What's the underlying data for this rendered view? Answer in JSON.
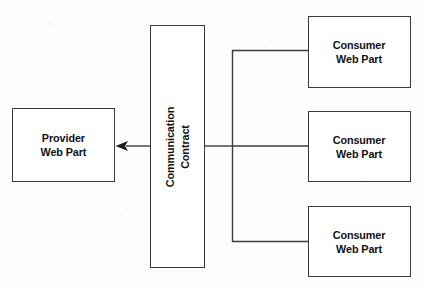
{
  "diagram": {
    "background_color": "#fdfdfd",
    "stroke_color": "#3b3b3b",
    "text_color": "#111111",
    "nodes": {
      "provider": {
        "label": "Provider\nWeb Part",
        "line_1": "Provider",
        "line_2": "Web Part",
        "orientation": "horizontal"
      },
      "contract": {
        "label": "Communication\nContract",
        "line_1": "Communication",
        "line_2": "Contract",
        "orientation": "vertical-bottom-to-top"
      },
      "consumers": [
        {
          "label": "Consumer\nWeb Part",
          "line_1": "Consumer",
          "line_2": "Web Part",
          "position": "top"
        },
        {
          "label": "Consumer\nWeb Part",
          "line_1": "Consumer",
          "line_2": "Web Part",
          "position": "middle"
        },
        {
          "label": "Consumer\nWeb Part",
          "line_1": "Consumer",
          "line_2": "Web Part",
          "position": "bottom"
        }
      ]
    },
    "connectors": {
      "arrow_to_provider": {
        "from": "contract",
        "to": "provider",
        "arrowhead": "left",
        "style": "solid"
      },
      "contract_to_bracket": {
        "from": "contract",
        "to": "consumer-bracket",
        "style": "solid"
      },
      "bracket_branches": [
        {
          "to": "consumer-1",
          "style": "solid"
        },
        {
          "to": "consumer-2",
          "style": "solid"
        },
        {
          "to": "consumer-3",
          "style": "solid"
        }
      ]
    }
  }
}
